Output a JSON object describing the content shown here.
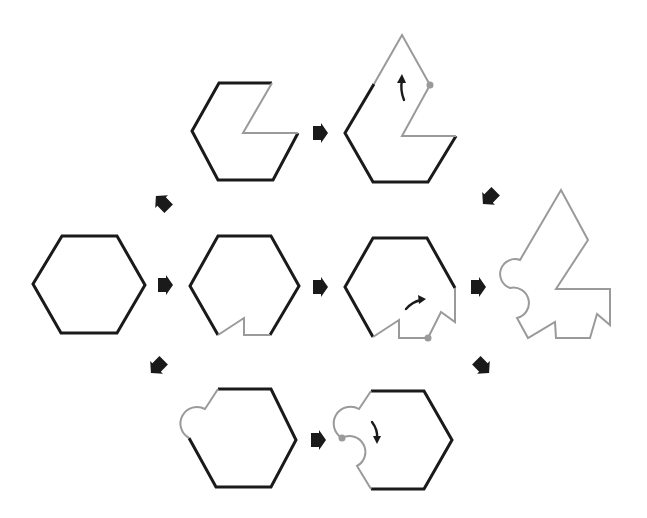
{
  "diagram": {
    "colors": {
      "original_edge": "#1a1a1a",
      "modified_edge": "#9a9a9a",
      "arrow": "#1a1a1a",
      "background": "#ffffff"
    },
    "nodes": [
      {
        "id": "start-hexagon",
        "description": "Regular hexagon, all edges black"
      },
      {
        "id": "top-step1",
        "description": "Hexagon with right-upper wedge cut out (gray edges)"
      },
      {
        "id": "top-step2",
        "description": "Cut-out rotated about a vertex to top (gray edges, rotation arrow, pivot dot)"
      },
      {
        "id": "mid-step1",
        "description": "Hexagon with bottom notch (gray edges)"
      },
      {
        "id": "mid-step2",
        "description": "Notch rotated onto lower-right edge (gray edges, rotation arrow, pivot dot)"
      },
      {
        "id": "bottom-step1",
        "description": "Hexagon with a semicircular bump on upper-left edge (gray)"
      },
      {
        "id": "bottom-step2",
        "description": "Bump rotated to lower-left edge creating interlocking curve (rotation arrow, pivot dot)"
      },
      {
        "id": "final-tile",
        "description": "Combined final tile with all modifications, gray outline"
      }
    ],
    "arrows": [
      {
        "from": "start-hexagon",
        "to": "top-step1",
        "direction": "up-right"
      },
      {
        "from": "start-hexagon",
        "to": "mid-step1",
        "direction": "right"
      },
      {
        "from": "start-hexagon",
        "to": "bottom-step1",
        "direction": "down-right"
      },
      {
        "from": "top-step1",
        "to": "top-step2",
        "direction": "right"
      },
      {
        "from": "mid-step1",
        "to": "mid-step2",
        "direction": "right"
      },
      {
        "from": "bottom-step1",
        "to": "bottom-step2",
        "direction": "right"
      },
      {
        "from": "top-step2",
        "to": "final-tile",
        "direction": "down-right"
      },
      {
        "from": "mid-step2",
        "to": "final-tile",
        "direction": "right"
      },
      {
        "from": "bottom-step2",
        "to": "final-tile",
        "direction": "up-right"
      }
    ]
  }
}
